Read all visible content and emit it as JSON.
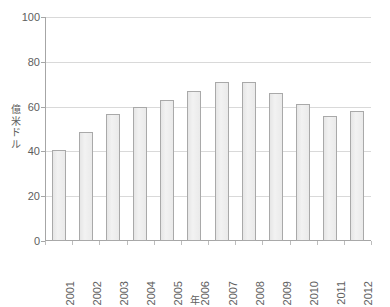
{
  "chart_data": {
    "type": "bar",
    "title": "",
    "xlabel": "年",
    "ylabel": "億米ドル",
    "categories": [
      "2001",
      "2002",
      "2003",
      "2004",
      "2005",
      "2006",
      "2007",
      "2008",
      "2009",
      "2010",
      "2011",
      "2012"
    ],
    "values": [
      40.5,
      48.5,
      56.5,
      60,
      63,
      67,
      71,
      71,
      66,
      61,
      56,
      58
    ],
    "ylim": [
      0,
      100
    ],
    "yticks": [
      0,
      20,
      40,
      60,
      80,
      100
    ],
    "ytick_labels": [
      "0",
      "20",
      "40",
      "60",
      "80",
      "100"
    ],
    "grid": true,
    "legend": "none",
    "series_color": "#ededed",
    "series_border_color": "#a9a9a9",
    "gridline_color": "#d9d9d9",
    "axis_color": "#a6a6a6",
    "text_color": "#5e5e5e"
  },
  "y_axis_title_chars": [
    "億",
    "米",
    "ド",
    "ル"
  ]
}
